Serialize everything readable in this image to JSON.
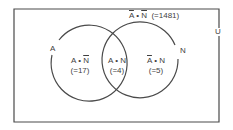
{
  "diagram": {
    "type": "venn",
    "universe_label": "U",
    "sets": [
      {
        "id": "A",
        "label": "A"
      },
      {
        "id": "N",
        "label": "N"
      }
    ],
    "regions": {
      "a_only": {
        "set_a": "A",
        "dot": "•",
        "set_b": "N",
        "b_complement": true,
        "count": "(=17)"
      },
      "both": {
        "set_a": "A",
        "dot": "•",
        "set_b": "N",
        "count": "(=4)"
      },
      "n_only": {
        "set_a": "A",
        "a_complement": true,
        "dot": "•",
        "set_b": "N",
        "count": "(=5)"
      },
      "neither": {
        "set_a": "A",
        "a_complement": true,
        "dot": "•",
        "set_b": "N",
        "b_complement": true,
        "count": "(=1481)"
      }
    },
    "colors": {
      "line": "#4a4a4a",
      "text": "#3f3f3f",
      "background": "#ffffff"
    }
  }
}
